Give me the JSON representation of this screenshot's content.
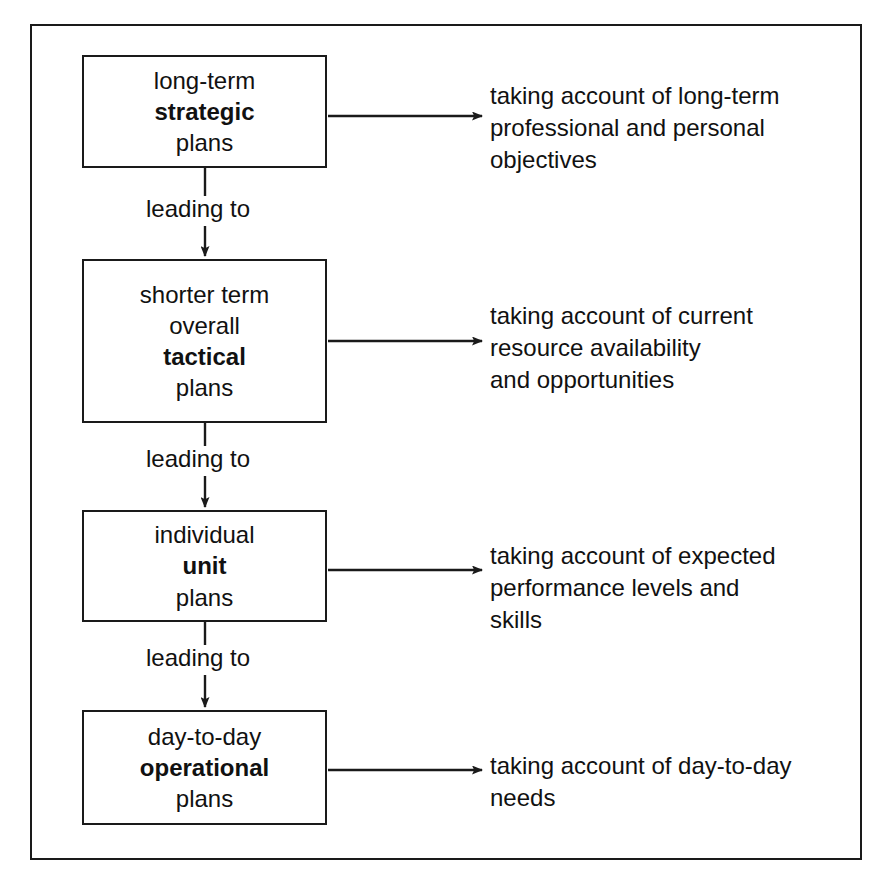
{
  "diagram": {
    "frame_color": "#1a1a1a",
    "background_color": "#ffffff",
    "text_color": "#111111",
    "connector_label": "leading to",
    "stages": [
      {
        "id": "strategic",
        "lines": [
          "long-term",
          "strategic",
          "plans"
        ],
        "emphasis_line": "strategic",
        "annotation": [
          "taking account of long-term",
          "professional and personal",
          "objectives"
        ]
      },
      {
        "id": "tactical",
        "lines": [
          "shorter term",
          "overall",
          "tactical",
          "plans"
        ],
        "emphasis_line": "tactical",
        "annotation": [
          "taking account of current",
          "resource availability",
          "and opportunities"
        ]
      },
      {
        "id": "unit",
        "lines": [
          "individual",
          "unit",
          "plans"
        ],
        "emphasis_line": "unit",
        "annotation": [
          "taking account of expected",
          "performance levels and",
          "skills"
        ]
      },
      {
        "id": "operational",
        "lines": [
          "day-to-day",
          "operational",
          "plans"
        ],
        "emphasis_line": "operational",
        "annotation": [
          "taking account of day-to-day",
          "needs"
        ]
      }
    ],
    "connectors": [
      {
        "from": "strategic",
        "to": "tactical",
        "label": "leading to"
      },
      {
        "from": "tactical",
        "to": "unit",
        "label": "leading to"
      },
      {
        "from": "unit",
        "to": "operational",
        "label": "leading to"
      }
    ]
  }
}
